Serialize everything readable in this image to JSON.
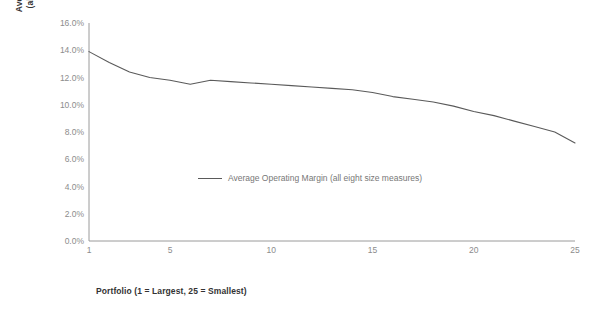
{
  "chart_data": {
    "type": "line",
    "title": "",
    "xlabel": "Portfolio (1 = Largest, 25 = Smallest)",
    "ylabel": "Average Operating Margin\n(all eight size measures)",
    "ylabel_line1": "Average Operating Margin",
    "ylabel_line2": "(all eight size measures)",
    "grid": false,
    "legend_position": "center",
    "xlim": [
      1,
      25
    ],
    "ylim": [
      0.0,
      16.0
    ],
    "x_tick_labels": [
      "1",
      "5",
      "10",
      "15",
      "20",
      "25"
    ],
    "x_ticks": [
      1,
      5,
      10,
      15,
      20,
      25
    ],
    "y_tick_labels": [
      "16.0%",
      "14.0%",
      "12.0%",
      "10.0%",
      "8.0%",
      "6.0%",
      "4.0%",
      "2.0%",
      "0.0%"
    ],
    "y_ticks": [
      16.0,
      14.0,
      12.0,
      10.0,
      8.0,
      6.0,
      4.0,
      2.0,
      0.0
    ],
    "series": [
      {
        "name": "Average Operating Margin (all eight size measures)",
        "color": "#5a5a5a",
        "x": [
          1,
          2,
          3,
          4,
          5,
          6,
          7,
          8,
          9,
          10,
          11,
          12,
          13,
          14,
          15,
          16,
          17,
          18,
          19,
          20,
          21,
          22,
          23,
          24,
          25
        ],
        "values": [
          13.9,
          13.1,
          12.4,
          12.0,
          11.8,
          11.5,
          11.8,
          11.7,
          11.6,
          11.5,
          11.4,
          11.3,
          11.2,
          11.1,
          10.9,
          10.6,
          10.4,
          10.2,
          9.9,
          9.5,
          9.2,
          8.8,
          8.4,
          8.0,
          7.2
        ]
      }
    ]
  },
  "legend": {
    "label": "Average Operating Margin (all eight size measures)"
  },
  "colors": {
    "line": "#5a5a5a",
    "axis": "#9a9a9a",
    "tick_text": "#8c8c8c",
    "title_text": "#333333",
    "background": "#ffffff"
  }
}
